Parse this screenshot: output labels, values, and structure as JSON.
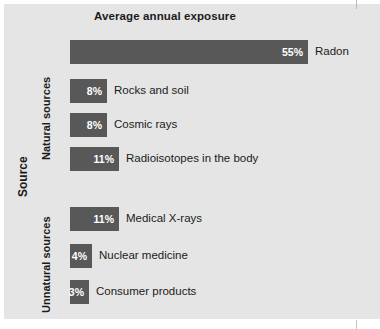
{
  "chart_data": {
    "type": "bar",
    "orientation": "horizontal",
    "title": "Average annual exposure",
    "xlabel": "",
    "ylabel": "Source",
    "unit": "%",
    "xlim": [
      0,
      55
    ],
    "grid": false,
    "legend": null,
    "groups": [
      {
        "name": "Natural sources",
        "categories": [
          "Radon",
          "Rocks and soil",
          "Cosmic rays",
          "Radioisotopes in the body"
        ],
        "values": [
          55,
          8,
          8,
          11
        ],
        "value_labels": [
          "55%",
          "8%",
          "8%",
          "11%"
        ]
      },
      {
        "name": "Unnatural sources",
        "categories": [
          "Medical X-rays",
          "Nuclear medicine",
          "Consumer products"
        ],
        "values": [
          11,
          4,
          3
        ],
        "value_labels": [
          "11%",
          "4%",
          "3%"
        ]
      }
    ],
    "categories": [
      "Radon",
      "Rocks and soil",
      "Cosmic rays",
      "Radioisotopes in the body",
      "Medical X-rays",
      "Nuclear medicine",
      "Consumer products"
    ],
    "values": [
      55,
      8,
      8,
      11,
      11,
      4,
      3
    ]
  },
  "colors": {
    "bar": "#585858",
    "panel_background": "#e5e5e5",
    "page_background": "#ffffff",
    "value_text": "#ffffff",
    "label_text": "#1b1b1b"
  },
  "bars": [
    {
      "label": "Radon",
      "value_label": "55%",
      "top": 40,
      "width": 238
    },
    {
      "label": "Rocks and soil",
      "value_label": "8%",
      "top": 79,
      "width": 37
    },
    {
      "label": "Cosmic rays",
      "value_label": "8%",
      "top": 113,
      "width": 37
    },
    {
      "label": "Radioisotopes in the body",
      "value_label": "11%",
      "top": 147,
      "width": 49
    },
    {
      "label": "Medical X-rays",
      "value_label": "11%",
      "top": 207,
      "width": 49
    },
    {
      "label": "Nuclear medicine",
      "value_label": "4%",
      "top": 244,
      "width": 22
    },
    {
      "label": "Consumer products",
      "value_label": "3%",
      "top": 280,
      "width": 19
    }
  ],
  "axis": {
    "title": "Source",
    "group_natural": "Natural sources",
    "group_unnatural": "Unnatural sources"
  }
}
